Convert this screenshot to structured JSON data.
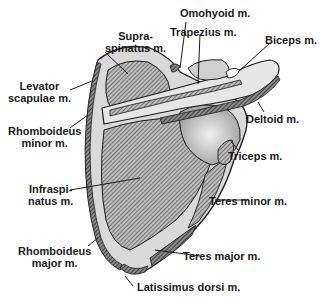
{
  "figure": {
    "colors": {
      "background": "#ffffff",
      "bone": "#d8d8d8",
      "bone_light": "#ececec",
      "muscle_hatch": "#555555",
      "outline": "#1a1a1a",
      "text": "#1a1a1a"
    }
  },
  "labels": [
    {
      "id": "supraspinatus",
      "line1": "Supra-",
      "line2": "spinatus m."
    },
    {
      "id": "omohyoid",
      "line1": "Omohyoid m."
    },
    {
      "id": "trapezius",
      "line1": "Trapezius m."
    },
    {
      "id": "biceps",
      "line1": "Biceps m."
    },
    {
      "id": "levator-scapulae",
      "line1": "Levator",
      "line2": "scapulae m."
    },
    {
      "id": "deltoid",
      "line1": "Deltoid m."
    },
    {
      "id": "rhomboideus-minor",
      "line1": "Rhomboideus",
      "line2": "minor m."
    },
    {
      "id": "triceps",
      "line1": "Triceps m."
    },
    {
      "id": "infraspinatus",
      "line1": "Infraspi-",
      "line2": "natus m."
    },
    {
      "id": "teres-minor",
      "line1": "Teres minor m."
    },
    {
      "id": "rhomboideus-major",
      "line1": "Rhomboideus",
      "line2": "major m."
    },
    {
      "id": "teres-major",
      "line1": "Teres major m."
    },
    {
      "id": "latissimus-dorsi",
      "line1": "Latissimus dorsi m."
    }
  ]
}
